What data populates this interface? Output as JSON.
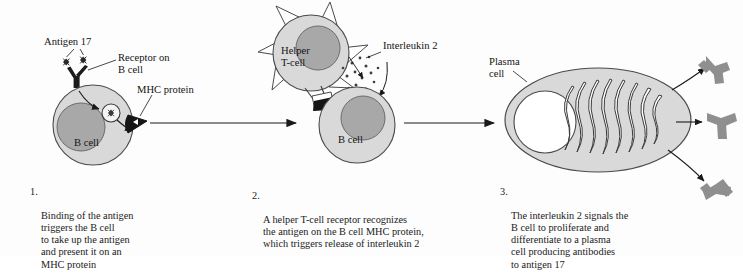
{
  "figure": {
    "background_color": "#fdfdfd",
    "ink_color": "#1a1a1a",
    "cell_fill": "#d9d9d9",
    "nucleus_fill": "#a8a8a8",
    "antibody_fill": "#8f8f8f",
    "mhc_fill": "#1c1c1c"
  },
  "labels": {
    "antigen": "Antigen 17",
    "receptor": "Receptor on\nB cell",
    "mhc": "MHC protein",
    "b_cell_1": "B cell",
    "helper_t": "Helper\nT-cell",
    "interleukin": "Interleukin 2",
    "b_cell_2": "B cell",
    "plasma": "Plasma\ncell"
  },
  "captions": [
    {
      "number": "1.",
      "text": "Binding of the antigen\ntriggers the B cell\nto take up the antigen\nand present it on an\nMHC protein"
    },
    {
      "number": "2.",
      "text": "A helper T-cell receptor recognizes\nthe antigen on the B cell MHC protein,\nwhich triggers release of interleukin 2"
    },
    {
      "number": "3.",
      "text": "The interleukin 2 signals the\nB cell to proliferate and\ndifferentiate to a plasma\ncell producing antibodies\nto antigen 17"
    }
  ]
}
